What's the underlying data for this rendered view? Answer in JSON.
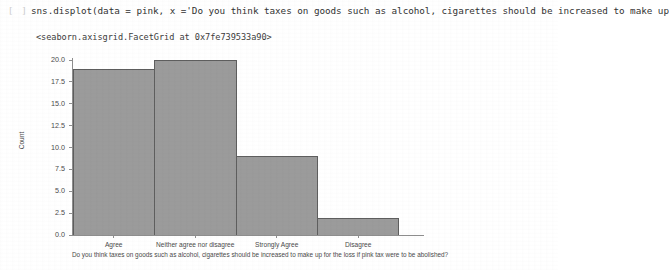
{
  "notebook": {
    "prompt": "[ ]",
    "code_line": "sns.displot(data = pink, x ='Do you think taxes on goods such as alcohol, cigarettes should be increased to make up",
    "output_repr": "<seaborn.axisgrid.FacetGrid at 0x7fe739533a90>"
  },
  "chart_data": {
    "type": "bar",
    "title": "",
    "categories": [
      "Agree",
      "Neither agree nor disagree",
      "Strongly Agree",
      "Disagree"
    ],
    "values": [
      19,
      20,
      9,
      2
    ],
    "xlabel": "Do you think taxes on goods such as alcohol, cigarettes should be increased to make up for the loss if pink tax were to be abolished?",
    "ylabel": "Count",
    "ylim": [
      0,
      20
    ],
    "yticks": [
      "0.0",
      "2.5",
      "5.0",
      "7.5",
      "10.0",
      "12.5",
      "15.0",
      "17.5",
      "20.0"
    ],
    "ytick_values": [
      0,
      2.5,
      5,
      7.5,
      10,
      12.5,
      15,
      17.5,
      20
    ],
    "grid": false,
    "legend": false,
    "bar_color": "#9b9b9b",
    "bar_edge_color": "#5e5e5e",
    "background_color": "#ffffff"
  }
}
